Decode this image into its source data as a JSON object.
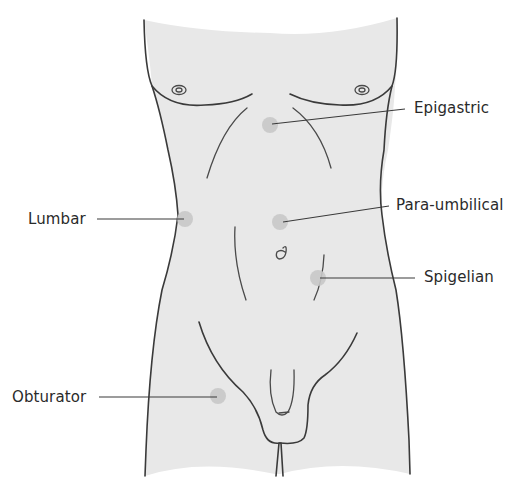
{
  "figure": {
    "type": "anatomical diagram",
    "colors": {
      "skin_fill": "#e8e8e8",
      "outline": "#3a3a3a",
      "hernia_spot": "#c8c8c8",
      "label_text": "#2a2a2a",
      "background": "#ffffff"
    }
  },
  "labels": [
    {
      "id": "epigastric",
      "text": "Epigastric",
      "side": "right",
      "spot": {
        "x": 270,
        "y": 125
      }
    },
    {
      "id": "para-umbilical",
      "text": "Para-umbilical",
      "side": "right",
      "spot": {
        "x": 280,
        "y": 222
      }
    },
    {
      "id": "spigelian",
      "text": "Spigelian",
      "side": "right",
      "spot": {
        "x": 318,
        "y": 278
      }
    },
    {
      "id": "lumbar",
      "text": "Lumbar",
      "side": "left",
      "spot": {
        "x": 185,
        "y": 219
      }
    },
    {
      "id": "obturator",
      "text": "Obturator",
      "side": "left",
      "spot": {
        "x": 218,
        "y": 396
      }
    }
  ]
}
